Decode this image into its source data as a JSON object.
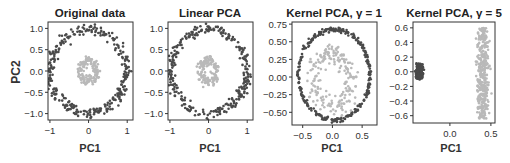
{
  "figure": {
    "ylabel_shared": "PC2",
    "colors": {
      "outer": "#4a4a4a",
      "inner": "#b9b9b9",
      "axis": "#333333",
      "text": "#333333"
    }
  },
  "chart_data": [
    {
      "type": "scatter",
      "title": "Original data",
      "xlabel": "PC1",
      "ylabel": "PC2",
      "xlim": [
        -1.05,
        1.15
      ],
      "ylim": [
        -1.15,
        1.15
      ],
      "xticks": [
        -1,
        0,
        1
      ],
      "xtick_labels": [
        "-1",
        "0",
        "1"
      ],
      "yticks": [
        1.0,
        0.5,
        0.0,
        -0.5,
        -1.0
      ],
      "ytick_labels": [
        "1.0",
        "0.5",
        "0.0",
        "-0.5",
        "-1.0"
      ],
      "box": {
        "x": 48,
        "y": 22,
        "w": 85,
        "h": 98
      },
      "series": [
        {
          "name": "outer circle",
          "color": "#4a4a4a",
          "shape": "ring",
          "cx": 0,
          "cy": 0,
          "rx": 0.98,
          "ry": 0.98,
          "noise": 0.06,
          "n": 300
        },
        {
          "name": "inner circle",
          "color": "#b9b9b9",
          "shape": "ring",
          "cx": 0,
          "cy": 0,
          "rx": 0.2,
          "ry": 0.25,
          "noise": 0.05,
          "n": 150
        }
      ]
    },
    {
      "type": "scatter",
      "title": "Linear PCA",
      "xlabel": "PC1",
      "ylabel": "",
      "xlim": [
        -1.05,
        1.15
      ],
      "ylim": [
        -1.15,
        1.15
      ],
      "xticks": [
        -1,
        0,
        1
      ],
      "xtick_labels": [
        "-1",
        "0",
        "1"
      ],
      "yticks": [
        1.0,
        0.5,
        0.0,
        -0.5,
        -1.0
      ],
      "ytick_labels": [
        "1.0",
        "0.5",
        "0.0",
        "-0.5",
        "-1.0"
      ],
      "box": {
        "x": 168,
        "y": 22,
        "w": 85,
        "h": 98
      },
      "series": [
        {
          "name": "outer circle",
          "color": "#4a4a4a",
          "shape": "ring",
          "cx": 0.0,
          "cy": 0,
          "rx": 0.98,
          "ry": 0.98,
          "noise": 0.06,
          "n": 300
        },
        {
          "name": "inner circle",
          "color": "#b9b9b9",
          "shape": "ring",
          "cx": 0,
          "cy": 0,
          "rx": 0.2,
          "ry": 0.25,
          "noise": 0.05,
          "n": 150
        }
      ]
    },
    {
      "type": "scatter",
      "title": "Kernel PCA, γ = 1",
      "xlabel": "PC1",
      "ylabel": "",
      "xlim": [
        -0.68,
        0.75
      ],
      "ylim": [
        -0.68,
        0.78
      ],
      "xticks": [
        -0.5,
        0.0,
        0.5
      ],
      "xtick_labels": [
        "-0.5",
        "0.0",
        "0.5"
      ],
      "yticks": [
        0.75,
        0.5,
        0.25,
        0.0,
        -0.25,
        -0.5
      ],
      "ytick_labels": [
        "0.75",
        "0.50",
        "0.25",
        "0.00",
        "-0.25",
        "-0.50"
      ],
      "box": {
        "x": 292,
        "y": 22,
        "w": 85,
        "h": 103
      },
      "series": [
        {
          "name": "outer circle",
          "color": "#4a4a4a",
          "shape": "ring",
          "cx": 0.03,
          "cy": 0.03,
          "rx": 0.6,
          "ry": 0.64,
          "noise": 0.015,
          "n": 300
        },
        {
          "name": "inner circle",
          "color": "#b9b9b9",
          "shape": "ring",
          "cx": 0.0,
          "cy": -0.05,
          "rx": 0.3,
          "ry": 0.38,
          "noise": 0.07,
          "n": 200
        }
      ]
    },
    {
      "type": "scatter",
      "title": "Kernel PCA, γ = 5",
      "xlabel": "PC1",
      "ylabel": "",
      "xlim": [
        -0.45,
        0.55
      ],
      "ylim": [
        -0.7,
        0.68
      ],
      "xticks": [
        0.0,
        0.5
      ],
      "xtick_labels": [
        "0.0",
        "0.5"
      ],
      "yticks": [
        0.6,
        0.4,
        0.2,
        0.0,
        -0.2,
        -0.4,
        -0.6
      ],
      "ytick_labels": [
        "0.6",
        "0.4",
        "0.2",
        "0.0",
        "-0.2",
        "-0.4",
        "-0.6"
      ],
      "box": {
        "x": 413,
        "y": 22,
        "w": 82,
        "h": 101
      },
      "series": [
        {
          "name": "outer circle",
          "color": "#4a4a4a",
          "shape": "ring",
          "cx": -0.37,
          "cy": 0.0,
          "rx": 0.025,
          "ry": 0.09,
          "noise": 0.012,
          "n": 200
        },
        {
          "name": "inner circle",
          "color": "#b9b9b9",
          "shape": "band",
          "cx": 0.4,
          "cy": -0.02,
          "rx": 0.06,
          "ry": 0.62,
          "noise": 0.02,
          "n": 350
        }
      ]
    }
  ]
}
